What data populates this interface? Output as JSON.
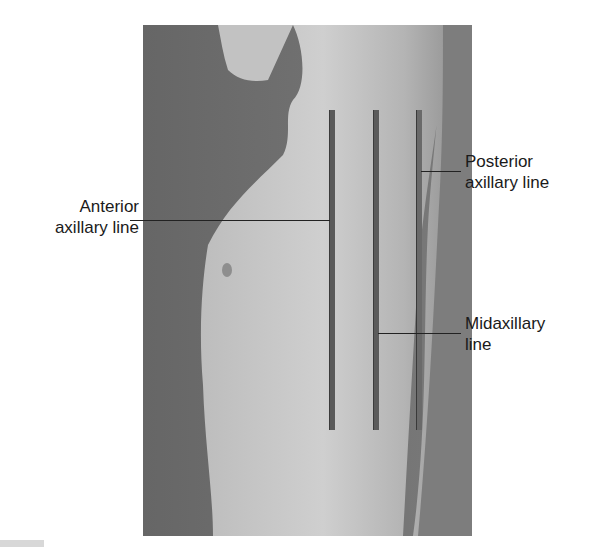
{
  "figure": {
    "type": "anatomical-photo",
    "labels": [
      {
        "id": "anterior",
        "line1": "Anterior",
        "line2": "axillary line"
      },
      {
        "id": "posterior",
        "line1": "Posterior",
        "line2": "axillary line"
      },
      {
        "id": "mid",
        "line1": "Midaxillary",
        "line2": "line"
      }
    ],
    "colors": {
      "background": "#6e6e6e",
      "skin_light": "#c9c9c9",
      "line": "#555555",
      "text": "#1a1a1a"
    }
  }
}
